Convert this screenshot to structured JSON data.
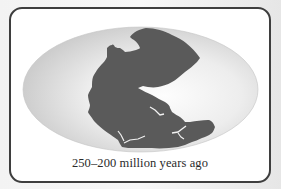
{
  "figure": {
    "caption": "250–200 million years ago",
    "projection": "elliptical (Mollweide-style) globe projection"
  },
  "colors": {
    "frame_border": "#3e3e3e",
    "frame_fill": "#ffffff",
    "ocean_center": "#fbfbfb",
    "ocean_edge": "#cfcfcf",
    "landmass": "#5a5a5a",
    "caption_text": "#2a2a2a"
  }
}
